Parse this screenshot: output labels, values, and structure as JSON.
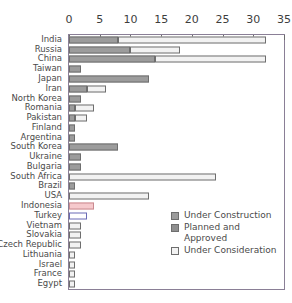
{
  "chart_data": {
    "type": "bar",
    "orientation": "horizontal",
    "stacked": true,
    "title": "",
    "subtitle": "",
    "xlabel": "",
    "ylabel": "",
    "xlim": [
      0,
      35
    ],
    "xticks": [
      0,
      5,
      10,
      15,
      20,
      25,
      30,
      35
    ],
    "xtick_labels": [
      "0",
      "5",
      "10",
      "15",
      "20",
      "25",
      "30",
      "35"
    ],
    "grid": false,
    "legend_position": "inside-lower-right",
    "categories": [
      "India",
      "Russia",
      "China",
      "Taiwan",
      "Japan",
      "Iran",
      "North Korea",
      "Romania",
      "Pakistan",
      "Finland",
      "Argentina",
      "South Korea",
      "Ukraine",
      "Bulgaria",
      "South Africa",
      "Brazil",
      "USA",
      "Indonesia",
      "Turkey",
      "Vietnam",
      "Slovakia",
      "Czech Republic",
      "Lithuania",
      "Israel",
      "France",
      "Egypt"
    ],
    "series": [
      {
        "name": "Under Construction",
        "color": "#9c9c9c",
        "values": [
          8,
          10,
          14,
          2,
          13,
          3,
          2,
          1,
          1,
          1,
          1,
          8,
          2,
          2,
          0,
          1,
          0,
          0,
          0,
          0,
          0,
          0,
          0,
          0,
          0,
          0
        ]
      },
      {
        "name": "Planned and Approved",
        "color": "#8f8f8f",
        "values": [
          0,
          0,
          0,
          0,
          0,
          0,
          0,
          0,
          0,
          0,
          0,
          0,
          0,
          0,
          0,
          0,
          0,
          0,
          0,
          0,
          0,
          0,
          0,
          0,
          0,
          0
        ]
      },
      {
        "name": "Under Consideration",
        "color": "#f2f2f2",
        "values": [
          24,
          8,
          18,
          0,
          0,
          3,
          0,
          3,
          2,
          0,
          0,
          0,
          0,
          0,
          24,
          0,
          13,
          4,
          3,
          2,
          2,
          2,
          1,
          1,
          1,
          1
        ]
      }
    ],
    "highlights": {
      "Indonesia": "#f6c9cc",
      "Turkey": "#6a6ab5"
    },
    "totals": [
      32,
      18,
      32,
      2,
      13,
      6,
      2,
      4,
      3,
      1,
      1,
      8,
      2,
      2,
      24,
      1,
      13,
      4,
      3,
      2,
      2,
      2,
      1,
      1,
      1,
      1
    ]
  },
  "legend": {
    "items": [
      {
        "label": "Under Construction",
        "swatch": "uc"
      },
      {
        "label": "Planned and Approved",
        "swatch": "pa"
      },
      {
        "label": "Under Consideration",
        "swatch": "ucon"
      }
    ]
  }
}
